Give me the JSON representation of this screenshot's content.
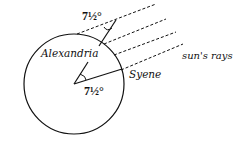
{
  "diagram": {
    "title": "",
    "labels": {
      "alexandria": "Alexandria",
      "syene": "Syene",
      "sun_rays": "sun's rays",
      "angle_top": "7½°",
      "angle_center": "7½°"
    },
    "elements": {
      "earth_circle": {
        "cx": 74,
        "cy": 84,
        "r": 50
      },
      "sun_ray_count": 4
    },
    "colors": {
      "stroke": "#111111",
      "background": "#ffffff"
    }
  }
}
